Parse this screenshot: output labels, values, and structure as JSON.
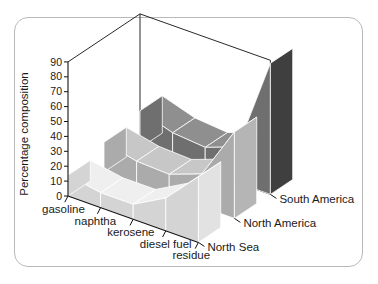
{
  "figure": {
    "border_color": "#b9b9b9",
    "background": "#ffffff"
  },
  "axes": {
    "ylabel": "Percentage composition",
    "yticks": [
      "0",
      "10",
      "20",
      "30",
      "40",
      "50",
      "60",
      "70",
      "80",
      "90"
    ],
    "ymin": 0,
    "ymax": 90
  },
  "chart_data": {
    "type": "area",
    "title": "",
    "xlabel": "",
    "ylabel": "Percentage composition",
    "ylim": [
      0,
      90
    ],
    "grid": false,
    "legend_position": "right-depth-axis",
    "categories": [
      "gasoline",
      "naphtha",
      "kerosene",
      "diesel fuel",
      "residue"
    ],
    "series": [
      {
        "name": "North Sea",
        "values": [
          14,
          10,
          10,
          22,
          44
        ],
        "color": "#efefef"
      },
      {
        "name": "North America",
        "values": [
          20,
          15,
          14,
          22,
          58
        ],
        "color": "#c7c7c7"
      },
      {
        "name": "South America",
        "values": [
          25,
          18,
          16,
          24,
          88
        ],
        "color": "#8f8f8f"
      }
    ]
  },
  "colors": {
    "series_front_top": "#efefef",
    "series_front_side": "#d4d4d4",
    "series_front_wall": "#e2e2e2",
    "series_mid_top": "#c7c7c7",
    "series_mid_side": "#ababab",
    "series_mid_wall": "#b5b5b5",
    "series_back_top": "#8f8f8f",
    "series_back_side": "#6f6f6f",
    "series_back_wall": "#3f3f3f",
    "box_line": "#111111",
    "text": "#1a1a1a"
  }
}
